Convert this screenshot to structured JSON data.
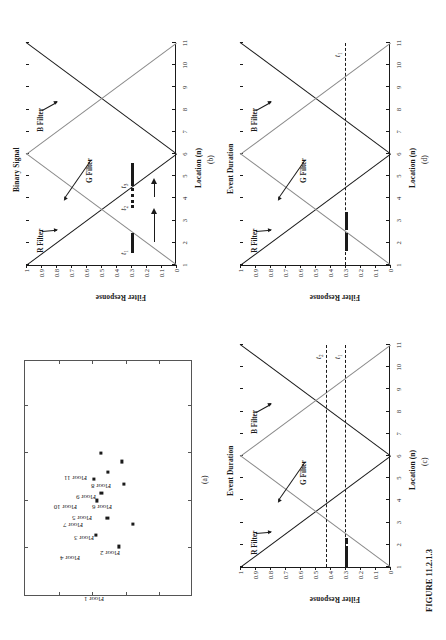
{
  "figure": {
    "caption": "FIGURE 11.2.1.3",
    "width": 446,
    "height": 640
  },
  "common": {
    "xlabel": "Location (n)",
    "ylabel_left": "Filter Response",
    "xticks": [
      "1",
      "2",
      "3",
      "4",
      "5",
      "6",
      "7",
      "8",
      "9",
      "10",
      "11"
    ],
    "yticks": [
      "0",
      "0.1",
      "0.2",
      "0.3",
      "0.4",
      "0.5",
      "0.6",
      "0.7",
      "0.8",
      "0.9",
      "1"
    ],
    "series_labels": {
      "r": "R Filter",
      "g": "G Filter",
      "b": "B Filter"
    },
    "colors": {
      "r_filter": "#1a1a1a",
      "g_filter": "#8a8a8a",
      "b_filter": "#1a1a1a",
      "event_bar": "#1a1a1a",
      "threshold": "#1a1a1a",
      "axis": "#1a1a1a"
    }
  },
  "panels": {
    "a": {
      "label": "(a)",
      "type": "scatter",
      "points": [
        {
          "name": "Floor 1",
          "x": 0.205,
          "y": 0.56,
          "lx": -0.035,
          "ly": 0.47,
          "rot": -90
        },
        {
          "name": "Floor 2",
          "x": 0.3,
          "y": 0.64,
          "lx": 0.16,
          "ly": 0.565,
          "rot": -90
        },
        {
          "name": "Floor 3",
          "x": 0.325,
          "y": 0.49,
          "lx": 0.225,
          "ly": 0.41,
          "rot": -90
        },
        {
          "name": "Floor 4",
          "x": 0.255,
          "y": 0.42,
          "lx": 0.14,
          "ly": 0.33,
          "rot": -90
        },
        {
          "name": "Floor 5",
          "x": 0.432,
          "y": 0.455,
          "lx": 0.31,
          "ly": 0.4,
          "rot": -90
        },
        {
          "name": "Floor 6",
          "x": 0.47,
          "y": 0.59,
          "lx": 0.355,
          "ly": 0.52,
          "rot": -90
        },
        {
          "name": "Floor 7",
          "x": 0.4,
          "y": 0.43,
          "lx": 0.28,
          "ly": 0.345,
          "rot": -90
        },
        {
          "name": "Floor 8",
          "x": 0.565,
          "y": 0.575,
          "lx": 0.445,
          "ly": 0.51,
          "rot": -90
        },
        {
          "name": "Floor 9",
          "x": 0.52,
          "y": 0.495,
          "lx": 0.4,
          "ly": 0.42,
          "rot": -90
        },
        {
          "name": "Floor 10",
          "x": 0.49,
          "y": 0.41,
          "lx": 0.355,
          "ly": 0.31,
          "rot": -90
        },
        {
          "name": "Floor 11",
          "x": 0.6,
          "y": 0.45,
          "lx": 0.48,
          "ly": 0.37,
          "rot": -90
        }
      ]
    },
    "b": {
      "label": "(b)",
      "right_axis_label": "Binary Signal",
      "events": [
        {
          "id": "t1",
          "label": "t",
          "sub": "1",
          "x_start": 1.55,
          "x_end": 2.45,
          "y": 0.3
        },
        {
          "id": "t2",
          "label": "t",
          "sub": "2",
          "x_start": 3.55,
          "x_end": 4.45,
          "y": 0.3,
          "style": "dotted"
        },
        {
          "id": "t3",
          "label": "t",
          "sub": "3",
          "x_start": 4.55,
          "x_end": 5.6,
          "y": 0.3
        }
      ],
      "arrows": [
        {
          "from_x": 2.05,
          "to_x": 3.55,
          "y": 0.15
        },
        {
          "from_x": 4.05,
          "to_x": 4.9,
          "y": 0.15
        }
      ]
    },
    "c": {
      "label": "(c)",
      "right_axis_label": "Event Duration",
      "thresholds": [
        {
          "id": "t1",
          "label": "t",
          "sub": "1",
          "value": 0.3
        },
        {
          "id": "t2",
          "label": "t",
          "sub": "2",
          "value": 0.43
        }
      ],
      "bars": [
        {
          "x_start": 1.0,
          "x_end": 1.95,
          "y": 0.3
        },
        {
          "x_start": 2.05,
          "x_end": 2.3,
          "y": 0.3
        }
      ]
    },
    "d": {
      "label": "(d)",
      "right_axis_label": "Event Duration",
      "thresholds": [
        {
          "id": "t1",
          "label": "t",
          "sub": "1",
          "value": 0.3
        }
      ],
      "bars": [
        {
          "x_start": 1.62,
          "x_end": 2.42,
          "y": 0.3
        },
        {
          "x_start": 2.58,
          "x_end": 3.38,
          "y": 0.3
        }
      ]
    }
  },
  "chart_data": {
    "type": "line",
    "title": "FIGURE 11.2.1.3",
    "xlabel": "Location (n)",
    "ylabel": "Filter Response",
    "xlim": [
      1,
      11
    ],
    "ylim": [
      0,
      1
    ],
    "grid": false,
    "legend": [
      "R Filter",
      "G Filter",
      "B Filter"
    ],
    "x": [
      1,
      2,
      3,
      4,
      5,
      6,
      7,
      8,
      9,
      10,
      11
    ],
    "series": [
      {
        "name": "R Filter",
        "values": [
          1.0,
          0.8,
          0.6,
          0.4,
          0.2,
          0.0,
          0.2,
          0.4,
          0.6,
          0.8,
          1.0
        ]
      },
      {
        "name": "G Filter",
        "values": [
          0.0,
          0.2,
          0.4,
          0.6,
          0.8,
          1.0,
          0.8,
          0.6,
          0.4,
          0.2,
          0.0
        ]
      },
      {
        "name": "B Filter",
        "values": [
          1.0,
          0.8,
          0.6,
          0.4,
          0.2,
          0.0,
          0.2,
          0.4,
          0.6,
          0.8,
          1.0
        ]
      }
    ],
    "annotations": [
      {
        "panel": "(b)",
        "type": "event-bar",
        "label": "t1",
        "x_range": [
          1.55,
          2.45
        ],
        "y": 0.3
      },
      {
        "panel": "(b)",
        "type": "event-bar-dotted",
        "label": "t2",
        "x_range": [
          3.55,
          4.45
        ],
        "y": 0.3
      },
      {
        "panel": "(b)",
        "type": "event-bar",
        "label": "t3",
        "x_range": [
          4.55,
          5.6
        ],
        "y": 0.3
      },
      {
        "panel": "(c)",
        "type": "threshold",
        "label": "t1",
        "y": 0.3
      },
      {
        "panel": "(c)",
        "type": "threshold",
        "label": "t2",
        "y": 0.43
      },
      {
        "panel": "(d)",
        "type": "threshold",
        "label": "t1",
        "y": 0.3
      }
    ],
    "scatter_panel": {
      "panel": "(a)",
      "type": "scatter",
      "point_labels": [
        "Floor 1",
        "Floor 2",
        "Floor 3",
        "Floor 4",
        "Floor 5",
        "Floor 6",
        "Floor 7",
        "Floor 8",
        "Floor 9",
        "Floor 10",
        "Floor 11"
      ]
    }
  }
}
